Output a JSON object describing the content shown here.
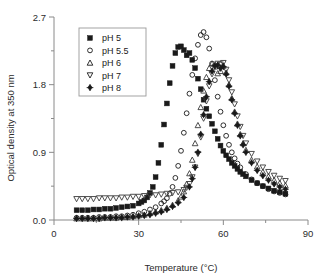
{
  "chart_data": {
    "type": "scatter",
    "title": "",
    "xlabel": "Temperature (°C)",
    "ylabel": "Optical density at 350 nm",
    "xlim": [
      0,
      90
    ],
    "ylim": [
      0.0,
      2.7
    ],
    "xticks": [
      0,
      30,
      60,
      90
    ],
    "xtick_labels": [
      "0",
      "30",
      "60",
      "90"
    ],
    "xminor_ticks": [
      15,
      45,
      75
    ],
    "yticks": [
      0.0,
      0.9,
      1.8,
      2.7
    ],
    "ytick_labels": [
      "0.0",
      "0.9",
      "1.8",
      "2.7"
    ],
    "yminor_ticks": [
      0.45,
      1.35,
      2.25
    ],
    "grid": false,
    "legend_position": "upper-left-inside",
    "series": [
      {
        "name": "pH 5",
        "marker": "filled-square",
        "color": "#1a1a1a",
        "x": [
          8,
          10,
          12,
          14,
          16,
          18,
          20,
          22,
          24,
          26,
          28,
          30,
          31,
          32,
          33,
          34,
          35,
          36,
          37,
          38,
          39,
          40,
          41,
          42,
          43,
          44,
          45,
          46,
          47,
          48,
          49,
          50,
          51,
          52,
          53,
          54,
          55,
          56,
          57,
          58,
          59,
          60,
          61,
          62,
          63,
          64,
          65,
          66,
          67,
          68,
          70,
          72,
          74,
          76,
          78,
          80,
          82
        ],
        "y": [
          0.13,
          0.13,
          0.13,
          0.14,
          0.14,
          0.15,
          0.15,
          0.16,
          0.17,
          0.18,
          0.19,
          0.22,
          0.24,
          0.26,
          0.3,
          0.36,
          0.44,
          0.57,
          0.76,
          1.0,
          1.27,
          1.55,
          1.82,
          2.05,
          2.22,
          2.3,
          2.31,
          2.26,
          2.19,
          2.22,
          2.13,
          2.02,
          1.88,
          1.74,
          1.6,
          1.48,
          1.38,
          1.28,
          1.18,
          1.08,
          0.99,
          0.92,
          0.86,
          0.81,
          0.76,
          0.72,
          0.68,
          0.64,
          0.61,
          0.58,
          0.53,
          0.49,
          0.45,
          0.42,
          0.39,
          0.37,
          0.35
        ]
      },
      {
        "name": "pH 5.5",
        "marker": "open-circle",
        "color": "#1a1a1a",
        "x": [
          8,
          10,
          12,
          14,
          16,
          18,
          20,
          22,
          24,
          26,
          28,
          30,
          32,
          34,
          36,
          38,
          39,
          40,
          41,
          42,
          43,
          44,
          45,
          46,
          47,
          48,
          49,
          50,
          51,
          52,
          53,
          54,
          55,
          56,
          57,
          58,
          59,
          60,
          61,
          62,
          63,
          64,
          65,
          66,
          68,
          70,
          72,
          74,
          76,
          78,
          80,
          82
        ],
        "y": [
          0.03,
          0.03,
          0.03,
          0.03,
          0.04,
          0.04,
          0.04,
          0.05,
          0.05,
          0.06,
          0.07,
          0.09,
          0.11,
          0.14,
          0.17,
          0.22,
          0.25,
          0.29,
          0.35,
          0.44,
          0.56,
          0.72,
          0.92,
          1.16,
          1.42,
          1.68,
          1.93,
          2.15,
          2.33,
          2.46,
          2.5,
          2.43,
          2.28,
          2.08,
          1.86,
          1.64,
          1.44,
          1.26,
          1.12,
          1.0,
          0.9,
          0.82,
          0.75,
          0.7,
          0.61,
          0.54,
          0.49,
          0.45,
          0.41,
          0.38,
          0.36,
          0.34
        ]
      },
      {
        "name": "pH 6",
        "marker": "open-triangle-up",
        "color": "#3a3a3a",
        "x": [
          8,
          10,
          12,
          14,
          16,
          18,
          20,
          22,
          24,
          26,
          28,
          30,
          32,
          34,
          36,
          38,
          40,
          42,
          44,
          45,
          46,
          47,
          48,
          49,
          50,
          51,
          52,
          53,
          54,
          55,
          56,
          57,
          58,
          59,
          60,
          61,
          62,
          63,
          64,
          65,
          66,
          67,
          68,
          70,
          72,
          74,
          76,
          78,
          80,
          82
        ],
        "y": [
          0.02,
          0.02,
          0.02,
          0.02,
          0.02,
          0.03,
          0.03,
          0.03,
          0.04,
          0.04,
          0.05,
          0.06,
          0.07,
          0.09,
          0.11,
          0.13,
          0.16,
          0.2,
          0.26,
          0.31,
          0.38,
          0.48,
          0.62,
          0.8,
          1.02,
          1.26,
          1.5,
          1.72,
          1.9,
          2.02,
          2.08,
          2.04,
          1.95,
          1.98,
          2.05,
          1.96,
          1.8,
          1.62,
          1.44,
          1.28,
          1.14,
          1.02,
          0.93,
          0.8,
          0.71,
          0.64,
          0.58,
          0.53,
          0.49,
          0.46
        ]
      },
      {
        "name": "pH 7",
        "marker": "open-triangle-down",
        "color": "#3a3a3a",
        "x": [
          8,
          10,
          12,
          14,
          16,
          18,
          20,
          22,
          24,
          26,
          28,
          30,
          32,
          34,
          36,
          38,
          40,
          42,
          44,
          46,
          47,
          48,
          49,
          50,
          51,
          52,
          53,
          54,
          55,
          56,
          57,
          58,
          59,
          60,
          61,
          62,
          63,
          64,
          65,
          66,
          67,
          68,
          70,
          72,
          74,
          76,
          78,
          80,
          82
        ],
        "y": [
          0.28,
          0.28,
          0.28,
          0.28,
          0.29,
          0.29,
          0.29,
          0.29,
          0.3,
          0.3,
          0.31,
          0.31,
          0.32,
          0.33,
          0.33,
          0.34,
          0.35,
          0.36,
          0.37,
          0.4,
          0.43,
          0.48,
          0.57,
          0.7,
          0.88,
          1.1,
          1.35,
          1.58,
          1.78,
          1.94,
          2.04,
          2.08,
          2.07,
          2.09,
          2.0,
          1.86,
          1.7,
          1.54,
          1.38,
          1.24,
          1.12,
          1.02,
          0.88,
          0.78,
          0.7,
          0.64,
          0.59,
          0.55,
          0.52
        ]
      },
      {
        "name": "pH 8",
        "marker": "filled-diamond-plus",
        "color": "#1a1a1a",
        "x": [
          8,
          10,
          12,
          14,
          16,
          18,
          20,
          22,
          24,
          26,
          28,
          30,
          32,
          34,
          36,
          38,
          40,
          42,
          44,
          46,
          48,
          49,
          50,
          51,
          52,
          53,
          54,
          55,
          56,
          57,
          58,
          59,
          60,
          61,
          62,
          63,
          64,
          65,
          66,
          67,
          68,
          70,
          72,
          74,
          76,
          78,
          80,
          82
        ],
        "y": [
          0.02,
          0.02,
          0.02,
          0.02,
          0.02,
          0.03,
          0.03,
          0.03,
          0.03,
          0.04,
          0.04,
          0.05,
          0.06,
          0.07,
          0.09,
          0.11,
          0.14,
          0.18,
          0.23,
          0.3,
          0.44,
          0.55,
          0.7,
          0.9,
          1.14,
          1.4,
          1.64,
          1.84,
          1.98,
          2.05,
          2.06,
          2.02,
          2.04,
          1.94,
          1.78,
          1.6,
          1.42,
          1.26,
          1.12,
          1.0,
          0.9,
          0.76,
          0.66,
          0.59,
          0.53,
          0.48,
          0.44,
          0.41
        ]
      }
    ]
  },
  "legend": {
    "items": [
      {
        "label": "pH 5",
        "marker": "filled-square"
      },
      {
        "label": "pH 5.5",
        "marker": "open-circle"
      },
      {
        "label": "pH 6",
        "marker": "open-triangle-up"
      },
      {
        "label": "pH 7",
        "marker": "open-triangle-down"
      },
      {
        "label": "pH 8",
        "marker": "filled-diamond-plus"
      }
    ]
  },
  "colors": {
    "axis": "#8a8a8a",
    "text": "#2b2b2b",
    "marker_dark": "#1a1a1a",
    "marker_mid": "#3a3a3a",
    "legend_border": "#9a9a9a",
    "background": "#ffffff"
  }
}
